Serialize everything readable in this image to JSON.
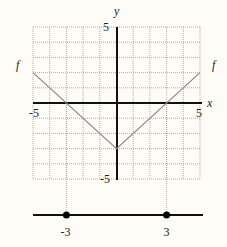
{
  "figure": {
    "type": "function-graph-with-number-line",
    "function_label": "f",
    "axis_labels": {
      "x": "x",
      "y": "y"
    },
    "tick_labels": {
      "x_min": "-5",
      "x_max": "5",
      "y_max": "5",
      "y_min": "-5"
    },
    "domain": [
      -5,
      5
    ],
    "range_shown": [
      -5,
      5
    ],
    "grid": {
      "x_step": 1,
      "y_step": 1,
      "style": "dotted"
    },
    "function_points": [
      [
        -5,
        2
      ],
      [
        0,
        -3
      ],
      [
        5,
        2
      ]
    ],
    "number_line": {
      "points": [
        -3,
        3
      ],
      "point_labels": [
        "-3",
        "3"
      ]
    },
    "colors": {
      "background": "#fdfcf7",
      "axes": "#111111",
      "grid": "#9a9a9a",
      "function": "#8a8a8a",
      "dots": "#000000"
    }
  }
}
